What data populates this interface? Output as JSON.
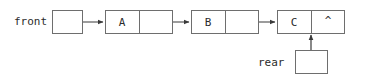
{
  "diagram": {
    "type": "linked-list",
    "colors": {
      "background": "#ffffff",
      "stroke": "#6e6e6e",
      "arrow": "#3a3a3a",
      "text": "#2b2b2b"
    },
    "pointers": {
      "front": {
        "label": "front",
        "target": "node-a"
      },
      "rear": {
        "label": "rear",
        "target": "node-c"
      }
    },
    "nodes": [
      {
        "id": "node-a",
        "data": "A",
        "next": "node-b",
        "next_text": ""
      },
      {
        "id": "node-b",
        "data": "B",
        "next": "node-c",
        "next_text": ""
      },
      {
        "id": "node-c",
        "data": "C",
        "next": null,
        "next_text": "^"
      }
    ]
  }
}
